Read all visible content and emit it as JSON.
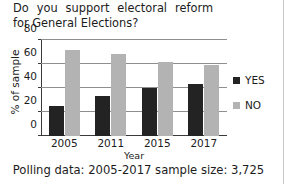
{
  "title": {
    "line1": "Do you support electoral reform",
    "line2": "for General Elections?"
  },
  "caption": "Polling data: 2005-2017 sample size: 3,725",
  "legend": {
    "position": "right",
    "items": [
      {
        "label": "YES",
        "color": "#232323"
      },
      {
        "label": "NO",
        "color": "#b3b3b3"
      }
    ]
  },
  "chart_data": {
    "type": "bar",
    "title": "Do you support electoral reform for General Elections?",
    "xlabel": "Year",
    "ylabel": "% of sample",
    "categories": [
      "2005",
      "2011",
      "2015",
      "2017"
    ],
    "series": [
      {
        "name": "YES",
        "color": "#232323",
        "values": [
          25,
          33,
          40,
          43
        ]
      },
      {
        "name": "NO",
        "color": "#b3b3b3",
        "values": [
          72,
          68,
          62,
          59
        ]
      }
    ],
    "ylim": [
      0,
      80
    ],
    "yticks": [
      "0",
      "20",
      "40",
      "60",
      "80"
    ],
    "ytick_values": [
      0,
      20,
      40,
      60,
      80
    ],
    "grid": true,
    "legend_position": "right"
  }
}
